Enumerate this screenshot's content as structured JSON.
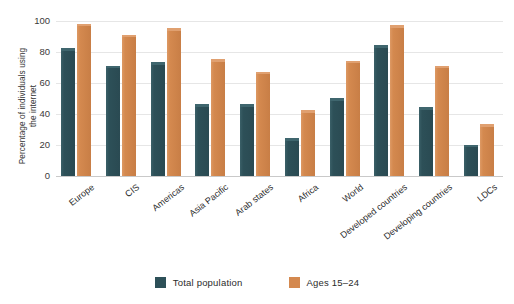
{
  "chart_data": {
    "type": "bar",
    "title": "",
    "subtitle": "",
    "xlabel": "",
    "ylabel": "Percentage of individuals using the internet",
    "ylim": [
      0,
      100
    ],
    "yticks": [
      0,
      20,
      40,
      60,
      80,
      100
    ],
    "ytick_labels": [
      "0",
      "20",
      "40",
      "60",
      "80",
      "100"
    ],
    "grid": true,
    "legend_position": "bottom",
    "categories": [
      "Europe",
      "CIS",
      "Americas",
      "Asia Pacific",
      "Arab states",
      "Africa",
      "World",
      "Developed countries",
      "Developing countries",
      "LDCs"
    ],
    "series": [
      {
        "name": "Total population",
        "color": "#2d5058",
        "values": [
          81,
          70,
          72,
          45,
          45,
          23,
          49,
          83,
          43,
          19
        ]
      },
      {
        "name": "Ages 15–24",
        "color": "#d4894f",
        "values": [
          97,
          90,
          94,
          74,
          66,
          41,
          73,
          96,
          70,
          32
        ]
      }
    ]
  },
  "axis": {
    "y_title": "Percentage of individuals using the internet",
    "y_title_line1": "Percentage of individuals using",
    "y_title_line2": "the internet"
  },
  "legend": {
    "entries": [
      {
        "label": "Total population",
        "color": "#2d5058"
      },
      {
        "label": "Ages 15–24",
        "color": "#d4894f"
      }
    ]
  }
}
